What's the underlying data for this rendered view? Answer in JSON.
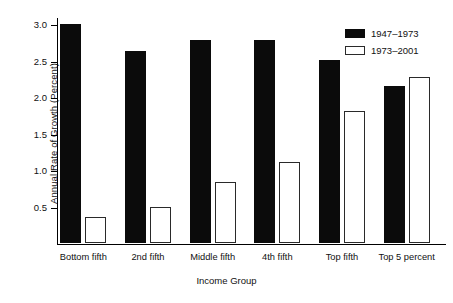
{
  "chart_data": {
    "type": "bar",
    "title": "",
    "subtitle": "",
    "xlabel": "Income Group",
    "ylabel": "Annual Rate of Growth (Percent)",
    "categories": [
      "Bottom fifth",
      "2nd fifth",
      "Middle fifth",
      "4th fifth",
      "Top fifth",
      "Top 5 percent"
    ],
    "series": [
      {
        "name": "1947–1973",
        "style": "filled",
        "color": "#0b0b0b",
        "values": [
          3.0,
          2.64,
          2.79,
          2.79,
          2.51,
          2.16
        ]
      },
      {
        "name": "1973–2001",
        "style": "hollow",
        "color": "#ffffff",
        "values": [
          0.36,
          0.5,
          0.84,
          1.11,
          1.81,
          2.28
        ]
      }
    ],
    "ylim": [
      0,
      3.1
    ],
    "yticks": [
      0.5,
      1.0,
      1.5,
      2.0,
      2.5,
      3.0
    ],
    "ytick_labels": [
      "0.5",
      "1.0",
      "1.5",
      "2.0",
      "2.5",
      "3.0"
    ],
    "grid": false,
    "legend_position": "top-right",
    "legend_entries": [
      "1947–1973",
      "1973–2001"
    ]
  }
}
